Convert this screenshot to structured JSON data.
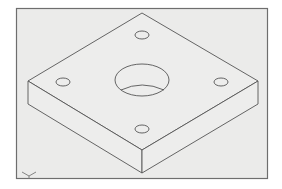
{
  "drawing": {
    "type": "isometric-cad-view",
    "subject": "square plate with one central through-hole and four corner holes",
    "colors": {
      "background": "#ffffff",
      "frame_fill": "#ebebea",
      "frame_border": "#6e6e6e",
      "line": "#555555"
    },
    "frame": {
      "x": 16,
      "y": 8,
      "width": 251,
      "height": 170
    },
    "plate": {
      "top_face": {
        "back": [
          142,
          13
        ],
        "left": [
          28,
          81
        ],
        "front": [
          142,
          150
        ],
        "right": [
          258,
          81
        ]
      },
      "thickness": 23
    },
    "center_hole": {
      "cx": 142,
      "cy": 80,
      "rx": 27,
      "ry": 16
    },
    "small_holes": [
      {
        "name": "back-hole",
        "cx": 142,
        "cy": 35,
        "rx": 7,
        "ry": 4
      },
      {
        "name": "left-hole",
        "cx": 63,
        "cy": 82,
        "rx": 7,
        "ry": 4
      },
      {
        "name": "right-hole",
        "cx": 221,
        "cy": 82,
        "rx": 7,
        "ry": 4
      },
      {
        "name": "front-hole",
        "cx": 142,
        "cy": 129,
        "rx": 7,
        "ry": 4
      }
    ],
    "ucs_icon": {
      "x": 22,
      "y": 172
    }
  }
}
